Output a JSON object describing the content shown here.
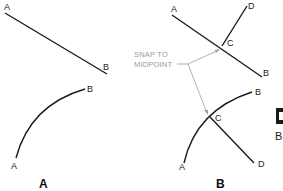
{
  "panel_a": {
    "caption": "A",
    "line": {
      "start_label": "A",
      "end_label": "B"
    },
    "arc": {
      "start_label": "A",
      "end_label": "B"
    }
  },
  "panel_b": {
    "caption": "B",
    "line": {
      "start_label": "A",
      "end_label": "B",
      "branch_point_label": "C",
      "branch_end_label": "D"
    },
    "arc": {
      "start_label": "A",
      "end_label": "B",
      "branch_point_label": "C",
      "branch_end_label": "D"
    },
    "annotation": {
      "line1": "SNAP TO",
      "line2": "MIDPOINT"
    }
  },
  "clipped_right": {
    "icon_glyph": "D",
    "label": "B"
  },
  "colors": {
    "stroke": "#1a1a1a",
    "leader": "#a0a0a0",
    "annotation_text": "#9a9a9a",
    "clipped_icon_bg": "#1a1a1a"
  }
}
